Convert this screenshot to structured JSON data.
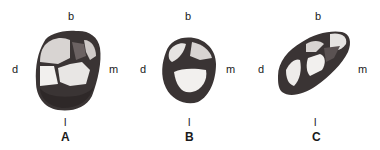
{
  "figure": {
    "panels": [
      {
        "id": "A",
        "caption": "A",
        "labels": {
          "buccal": "b",
          "distal": "d",
          "mesial": "m",
          "lingual": "l"
        }
      },
      {
        "id": "B",
        "caption": "B",
        "labels": {
          "buccal": "b",
          "distal": "d",
          "mesial": "m",
          "lingual": "l"
        }
      },
      {
        "id": "C",
        "caption": "C",
        "labels": {
          "buccal": "b",
          "distal": "d",
          "mesial": "m",
          "lingual": "l"
        }
      }
    ],
    "colors": {
      "background": "#ffffff",
      "enamel_dark": "#3a3434",
      "enamel_mid": "#6b6262",
      "enamel_light": "#e6e4e2",
      "text": "#1a1a1a"
    }
  }
}
